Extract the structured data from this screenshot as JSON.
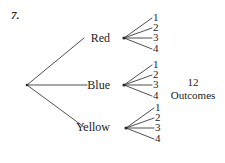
{
  "problem": {
    "number": "7."
  },
  "diagram": {
    "type": "probability-tree-diagram",
    "root": {
      "x": 27,
      "y": 85
    },
    "branches": [
      {
        "label": "Red",
        "node": {
          "x": 124,
          "y": 38
        },
        "label_pos": {
          "x": 85,
          "y": 38
        },
        "leaves": [
          {
            "label": "1",
            "y": 18
          },
          {
            "label": "2",
            "y": 28
          },
          {
            "label": "3",
            "y": 38
          },
          {
            "label": "4",
            "y": 48
          }
        ]
      },
      {
        "label": "Blue",
        "node": {
          "x": 124,
          "y": 85
        },
        "label_pos": {
          "x": 85,
          "y": 85
        },
        "leaves": [
          {
            "label": "1",
            "y": 65
          },
          {
            "label": "2",
            "y": 75
          },
          {
            "label": "3",
            "y": 85
          },
          {
            "label": "4",
            "y": 95
          }
        ]
      },
      {
        "label": "Yellow",
        "node": {
          "x": 126,
          "y": 128
        },
        "label_pos": {
          "x": 85,
          "y": 127
        },
        "leaves": [
          {
            "label": "1",
            "y": 108
          },
          {
            "label": "2",
            "y": 118
          },
          {
            "label": "3",
            "y": 128
          },
          {
            "label": "4",
            "y": 138
          }
        ]
      }
    ],
    "summary": {
      "count": "12",
      "word": "Outcomes"
    },
    "line_color": "#3b3b3b"
  }
}
